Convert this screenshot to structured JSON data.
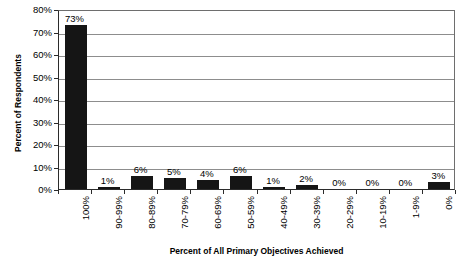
{
  "chart_data": {
    "type": "bar",
    "title": "",
    "xlabel": "Percent of All Primary Objectives Achieved",
    "ylabel": "Percent of Respondents",
    "categories": [
      "100%",
      "90-99%",
      "80-89%",
      "70-79%",
      "60-69%",
      "50-59%",
      "40-49%",
      "30-39%",
      "20-29%",
      "10-19%",
      "1-9%",
      "0%"
    ],
    "values": [
      73,
      1,
      6,
      5,
      4,
      6,
      1,
      2,
      0,
      0,
      0,
      3
    ],
    "data_labels": [
      "73%",
      "1%",
      "6%",
      "5%",
      "4%",
      "6%",
      "1%",
      "2%",
      "0%",
      "0%",
      "0%",
      "3%"
    ],
    "ylim": [
      0,
      80
    ],
    "ytick_labels": [
      "80%",
      "70%",
      "60%",
      "50%",
      "40%",
      "30%",
      "20%",
      "10%",
      "0%"
    ],
    "ytick_values": [
      80,
      70,
      60,
      50,
      40,
      30,
      20,
      10,
      0
    ],
    "grid": true,
    "legend": false,
    "series_color": "#151515",
    "gridline_color": "#8d8d8d",
    "axis_color": "#2b2b2b"
  }
}
